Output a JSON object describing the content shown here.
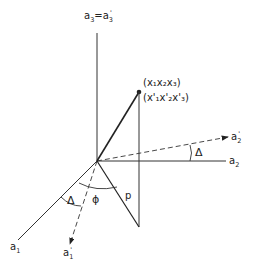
{
  "diagram": {
    "type": "3D coordinate axis rotation diagram",
    "axes": {
      "a3": {
        "label": "a",
        "sub": "3",
        "eq": "=",
        "label2": "a",
        "sub2": "3",
        "prime2": "'"
      },
      "a2": {
        "label": "a",
        "sub": "2"
      },
      "a2_prime": {
        "label": "a",
        "sub": "2",
        "prime": "'"
      },
      "a1": {
        "label": "a",
        "sub": "1"
      },
      "a1_prime": {
        "label": "a",
        "sub": "1",
        "prime": "'"
      }
    },
    "point": {
      "coords": "(x₁x₂x₃)",
      "coords_prime": "(x'₁x'₂x'₃)"
    },
    "angles": {
      "delta_top": "Δ",
      "delta_bottom": "Δ",
      "phi": "ϕ"
    },
    "segment_label": "p",
    "colors": {
      "line": "#222222",
      "background": "#ffffff"
    }
  }
}
